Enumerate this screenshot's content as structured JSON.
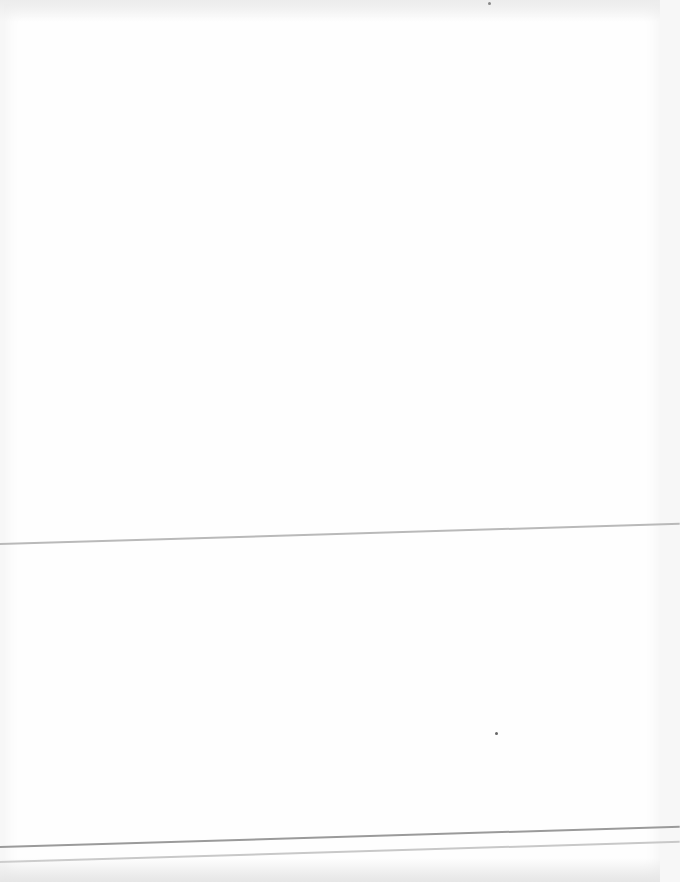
{
  "document": {
    "type": "blank paper sheet",
    "text_content": "",
    "colors": {
      "paper": "#fefefe",
      "fold_line": "#b9b9b9",
      "bottom_rule": "#9a9a9a",
      "bottom_rule_secondary": "#c8c8c8"
    }
  }
}
